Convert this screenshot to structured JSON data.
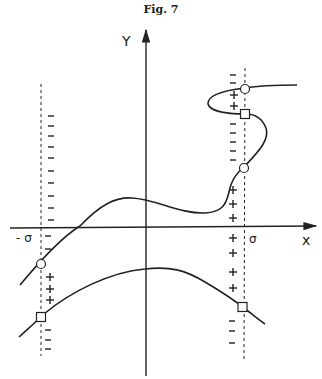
{
  "figure": {
    "title": "Fig. 7",
    "axes": {
      "x_label": "x",
      "y_label": "Y",
      "x_ticks": [
        "-σ",
        "σ"
      ]
    },
    "sign_markers": {
      "plus": "+",
      "minus": "−"
    },
    "marker_types": [
      "circle",
      "square"
    ],
    "colors": {
      "ink": "#222222",
      "background": "#ffffff"
    }
  }
}
